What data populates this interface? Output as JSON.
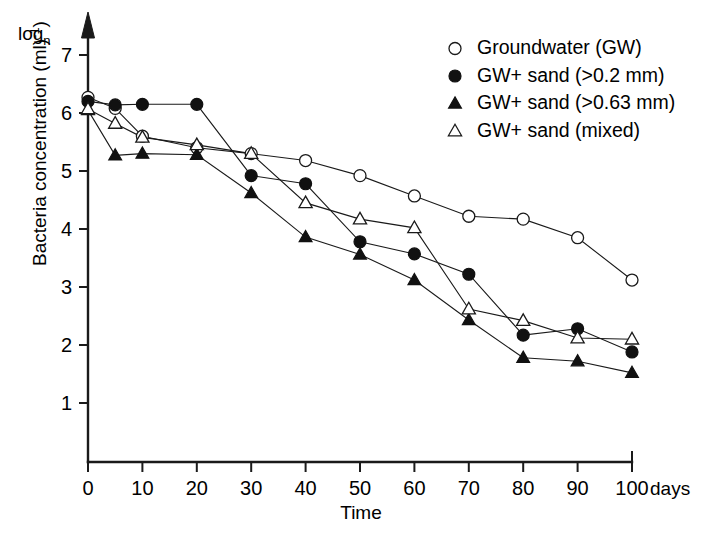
{
  "chart_data": {
    "type": "line",
    "title": "",
    "xlabel": "Time",
    "x_unit_label": "days",
    "ylabel": "Bacteria concentration (ml⁻¹)",
    "y_scale_label": "log",
    "y_scale_sub": "n",
    "x": [
      0,
      5,
      10,
      20,
      30,
      40,
      50,
      60,
      70,
      80,
      90,
      100
    ],
    "xticks": [
      "0",
      "10",
      "20",
      "30",
      "40",
      "50",
      "60",
      "70",
      "80",
      "90",
      "100"
    ],
    "xtick_values": [
      0,
      10,
      20,
      30,
      40,
      50,
      60,
      70,
      80,
      90,
      100
    ],
    "yticks": [
      "1",
      "2",
      "3",
      "4",
      "5",
      "6",
      "7"
    ],
    "ytick_values": [
      1,
      2,
      3,
      4,
      5,
      6,
      7
    ],
    "xlim": [
      0,
      100
    ],
    "ylim": [
      0.55,
      7.3
    ],
    "grid": false,
    "legend_position": "top-right",
    "series": [
      {
        "name": "Groundwater (GW)",
        "marker": "open-circle",
        "x": [
          0,
          5,
          10,
          20,
          30,
          40,
          50,
          60,
          70,
          80,
          90,
          100
        ],
        "values": [
          6.27,
          6.08,
          5.6,
          5.4,
          5.3,
          5.18,
          4.92,
          4.57,
          4.22,
          4.17,
          3.85,
          3.12
        ]
      },
      {
        "name": "GW+ sand (>0.2 mm)",
        "marker": "filled-circle",
        "x": [
          0,
          5,
          10,
          20,
          30,
          40,
          50,
          60,
          70,
          80,
          90,
          100
        ],
        "values": [
          6.2,
          6.14,
          6.15,
          6.15,
          4.92,
          4.78,
          3.78,
          3.57,
          3.22,
          2.17,
          2.28,
          1.88
        ]
      },
      {
        "name": "GW+ sand (>0.63 mm)",
        "marker": "filled-triangle",
        "x": [
          0,
          5,
          10,
          20,
          30,
          40,
          50,
          60,
          70,
          80,
          90,
          100
        ],
        "values": [
          6.05,
          5.27,
          5.3,
          5.28,
          4.62,
          3.86,
          3.56,
          3.12,
          2.43,
          1.78,
          1.72,
          1.52
        ]
      },
      {
        "name": "GW+ sand (mixed)",
        "marker": "open-triangle",
        "x": [
          0,
          5,
          10,
          20,
          30,
          40,
          50,
          60,
          70,
          80,
          90,
          100
        ],
        "values": [
          6.07,
          5.82,
          5.58,
          5.45,
          5.3,
          4.45,
          4.17,
          4.02,
          2.62,
          2.42,
          2.12,
          2.1
        ]
      }
    ]
  },
  "legend": {
    "items": [
      {
        "label": "Groundwater (GW)",
        "marker": "open-circle"
      },
      {
        "label": "GW+ sand (>0.2 mm)",
        "marker": "filled-circle"
      },
      {
        "label": "GW+ sand (>0.63 mm)",
        "marker": "filled-triangle"
      },
      {
        "label": "GW+ sand (mixed)",
        "marker": "open-triangle"
      }
    ]
  },
  "colors": {
    "axis": "#1a1a1a",
    "line": "#1a1a1a",
    "marker_fill": "#111111",
    "marker_open_fill": "#ffffff",
    "background": "#ffffff"
  }
}
